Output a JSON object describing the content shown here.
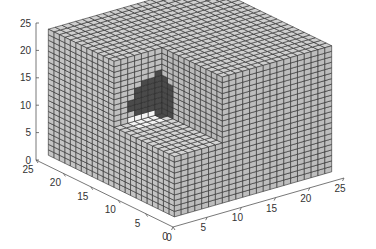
{
  "chart_data": {
    "type": "volume-slice-3d",
    "title": "",
    "xlabel": "",
    "ylabel": "",
    "zlabel": "",
    "x_ticks": [
      0,
      5,
      10,
      15,
      20,
      25
    ],
    "y_ticks": [
      0,
      5,
      10,
      15,
      20,
      25
    ],
    "z_ticks": [
      0,
      5,
      10,
      15,
      20,
      25
    ],
    "xlim": [
      0,
      25
    ],
    "ylim": [
      0,
      25
    ],
    "zlim": [
      0,
      25
    ],
    "grid": false,
    "volume_extent": [
      1,
      24
    ],
    "slice_planes": {
      "x": 8,
      "y": 12,
      "z": 12
    },
    "features": [
      {
        "name": "bright blob",
        "color": "#ffffff",
        "on_slice": "y=12",
        "approx_center": [
          5,
          12,
          10
        ]
      },
      {
        "name": "dark ring",
        "color": "#3a3a3a",
        "on_slice": "x=8",
        "approx_center": [
          8,
          16,
          15
        ]
      }
    ],
    "face_color": "#c8c8c8",
    "edge_color": "#2a2a2a"
  },
  "projection": {
    "origin": [
      173,
      227
    ],
    "x_unit": [
      6.84,
      -1.96
    ],
    "y_unit": [
      -5.48,
      -2.68
    ],
    "z_unit": [
      0,
      -5.48
    ]
  }
}
